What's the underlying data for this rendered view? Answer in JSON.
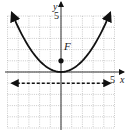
{
  "chart_data": {
    "type": "line",
    "title": "",
    "xlabel": "x",
    "ylabel": "y",
    "xlim": [
      -5,
      5
    ],
    "ylim": [
      -5,
      5
    ],
    "grid": true,
    "tick_labels": {
      "x": [
        "5"
      ],
      "y": [
        "5"
      ]
    },
    "series": [
      {
        "name": "parabola",
        "equation": "y = x^2/4",
        "style": "solid",
        "arrows": "both-ends",
        "x": [
          -4.6,
          -4,
          -3,
          -2,
          -1,
          0,
          1,
          2,
          3,
          4,
          4.6
        ],
        "y": [
          5.29,
          4,
          2.25,
          1,
          0.25,
          0,
          0.25,
          1,
          2.25,
          4,
          5.29
        ]
      },
      {
        "name": "directrix",
        "equation": "y = -1",
        "style": "dashed",
        "arrows": "both-ends",
        "x": [
          -4.6,
          4.6
        ],
        "y": [
          -1,
          -1
        ]
      }
    ],
    "points": [
      {
        "label": "F",
        "x": 0,
        "y": 1
      }
    ],
    "annotations": [
      "F"
    ]
  },
  "labels": {
    "x_axis": "x",
    "y_axis": "y",
    "x_tick": "5",
    "y_tick": "5",
    "focus": "F"
  }
}
